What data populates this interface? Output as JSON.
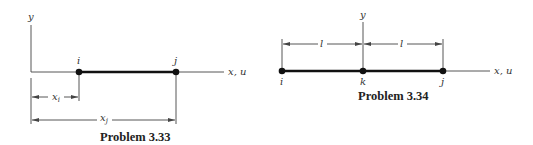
{
  "figures": [
    {
      "caption": "Problem 3.33",
      "axis_labels": {
        "vertical": "y",
        "horizontal": "x, u"
      },
      "nodes": [
        {
          "label": "i"
        },
        {
          "label": "j"
        }
      ],
      "dimensions": [
        {
          "label": "x",
          "subscript": "i"
        },
        {
          "label": "x",
          "subscript": "j"
        }
      ]
    },
    {
      "caption": "Problem 3.34",
      "axis_labels": {
        "vertical": "y",
        "horizontal": "x, u"
      },
      "nodes": [
        {
          "label": "i"
        },
        {
          "label": "k"
        },
        {
          "label": "j"
        }
      ],
      "dimensions": [
        {
          "label": "l"
        },
        {
          "label": "l"
        }
      ]
    }
  ]
}
